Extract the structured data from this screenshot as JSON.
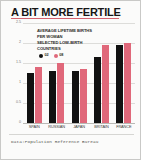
{
  "figure": {
    "headline": "A BIT MORE FERTILE",
    "caption": "Data:Population Reference Bureau",
    "annotation_lines": [
      "AVERAGE LIFETIME BIRTHS",
      "PER WOMAN",
      "SELECTED LOW-BIRTH",
      "COUNTRIES"
    ]
  },
  "colors": {
    "series_02": "#111111",
    "series_08": "#e0687a",
    "rule": "#d4626f",
    "background": "#fbfbfa",
    "grid": "#ddddda"
  },
  "chart_data": {
    "type": "bar",
    "title": "A BIT MORE FERTILE",
    "subtitle": "AVERAGE LIFETIME BIRTHS PER WOMAN — SELECTED LOW-BIRTH COUNTRIES",
    "xlabel": "",
    "ylabel": "",
    "ylim": [
      0,
      2.5
    ],
    "yticks": [
      "0",
      "0.5",
      "1",
      "1.5",
      "2",
      "2.5"
    ],
    "ytick_values": [
      0,
      0.5,
      1,
      1.5,
      2,
      2.5
    ],
    "grid": true,
    "legend_position": "inside-top-left",
    "categories": [
      "SPAIN",
      "RUSSIAN",
      "JAPAN",
      "BRITAIN",
      "FRANCE"
    ],
    "series": [
      {
        "name": "02",
        "color": "#111111",
        "values": [
          1.25,
          1.3,
          1.29,
          1.64,
          1.95
        ]
      },
      {
        "name": "08",
        "color": "#e0687a",
        "values": [
          1.4,
          1.5,
          1.34,
          1.96,
          1.99
        ]
      }
    ]
  }
}
